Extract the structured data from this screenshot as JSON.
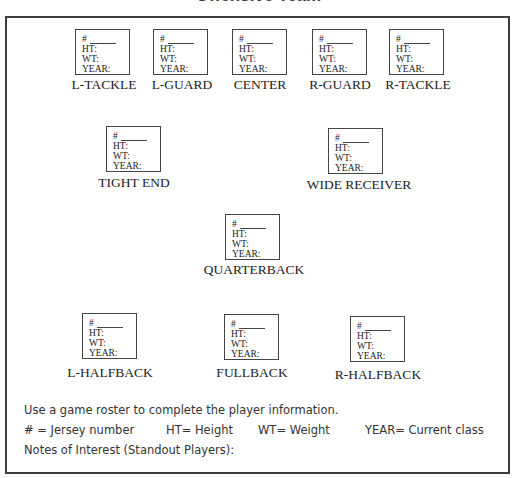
{
  "title": "Offensive Team",
  "field_labels": {
    "number": "#",
    "height": "HT:",
    "weight": "WT:",
    "year": "YEAR:"
  },
  "positions": [
    {
      "id": "l-tackle",
      "label": "L-TACKLE",
      "box": [
        75,
        29
      ],
      "label_xy": [
        104,
        78
      ]
    },
    {
      "id": "l-guard",
      "label": "L-GUARD",
      "box": [
        153,
        29
      ],
      "label_xy": [
        182,
        78
      ]
    },
    {
      "id": "center",
      "label": "CENTER",
      "box": [
        232,
        29
      ],
      "label_xy": [
        260,
        78
      ]
    },
    {
      "id": "r-guard",
      "label": "R-GUARD",
      "box": [
        312,
        29
      ],
      "label_xy": [
        340,
        78
      ]
    },
    {
      "id": "r-tackle",
      "label": "R-TACKLE",
      "box": [
        389,
        29
      ],
      "label_xy": [
        418,
        78
      ]
    },
    {
      "id": "tight-end",
      "label": "TIGHT END",
      "box": [
        106,
        126
      ],
      "label_xy": [
        134,
        176
      ]
    },
    {
      "id": "wide-receiver",
      "label": "WIDE RECEIVER",
      "box": [
        328,
        128
      ],
      "label_xy": [
        359,
        178
      ]
    },
    {
      "id": "quarterback",
      "label": "QUARTERBACK",
      "box": [
        225,
        214
      ],
      "label_xy": [
        254,
        263
      ]
    },
    {
      "id": "l-halfback",
      "label": "L-HALFBACK",
      "box": [
        82,
        313
      ],
      "label_xy": [
        110,
        366
      ]
    },
    {
      "id": "fullback",
      "label": "FULLBACK",
      "box": [
        224,
        314
      ],
      "label_xy": [
        252,
        366
      ]
    },
    {
      "id": "r-halfback",
      "label": "R-HALFBACK",
      "box": [
        350,
        316
      ],
      "label_xy": [
        378,
        368
      ]
    }
  ],
  "instructions": {
    "line1": "Use a game roster to complete the player information.",
    "legend": [
      {
        "text": "# = Jersey number",
        "x": 24
      },
      {
        "text": "HT= Height",
        "x": 166
      },
      {
        "text": "WT= Weight",
        "x": 258
      },
      {
        "text": "YEAR= Current class",
        "x": 365
      }
    ],
    "notes_label": "Notes of Interest (Standout Players):"
  }
}
